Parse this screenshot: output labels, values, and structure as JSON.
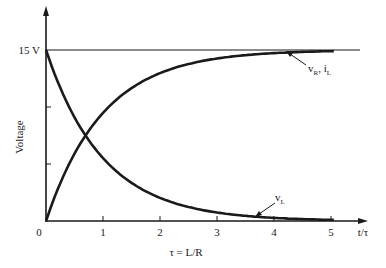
{
  "chart_data": {
    "type": "line",
    "title": "",
    "xlabel": "t/τ",
    "ylabel": "Voltage",
    "x_ticks": [
      "0",
      "1",
      "2",
      "3",
      "4",
      "5"
    ],
    "y_ticks": [
      "15 V"
    ],
    "xlim": [
      0,
      5.2
    ],
    "ylim": [
      0,
      15
    ],
    "grid": false,
    "annotation_below": "τ = L/R",
    "x": [
      0,
      0.5,
      1,
      1.5,
      2,
      2.5,
      3,
      3.5,
      4,
      4.5,
      5
    ],
    "series": [
      {
        "name": "vR, iL",
        "label_main": "v",
        "label_sub": "R",
        "label_sep": ", i",
        "label_sub2": "L",
        "values": [
          0,
          5.9,
          9.48,
          11.65,
          12.97,
          13.77,
          14.25,
          14.55,
          14.73,
          14.83,
          14.9
        ]
      },
      {
        "name": "vL",
        "label_main": "v",
        "label_sub": "L",
        "values": [
          15,
          9.1,
          5.52,
          3.35,
          2.03,
          1.23,
          0.75,
          0.45,
          0.27,
          0.17,
          0.1
        ]
      }
    ],
    "asymptote": {
      "value": 15,
      "label": "15 V"
    },
    "legend": "none (inline labels with arrows)"
  }
}
